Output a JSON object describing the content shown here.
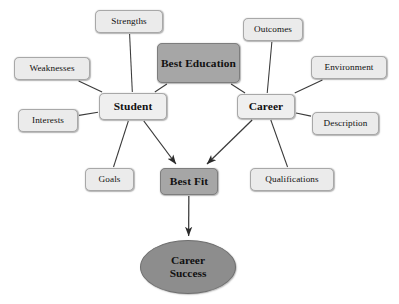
{
  "diagram": {
    "background_color": "#ffffff",
    "colors": {
      "leaf_fill": "#ebebeb",
      "hub_fill": "#efefef",
      "emphasis_fill": "#a6a6a6",
      "terminal_fill": "#8d8d8d",
      "border": "#a8a8a8",
      "line": "#3a3a3a",
      "text": "#111111"
    },
    "nodes": [
      {
        "id": "strengths",
        "label": "Strengths",
        "kind": "leaf",
        "x": 95,
        "y": 10,
        "w": 68,
        "h": 23
      },
      {
        "id": "weaknesses",
        "label": "Weaknesses",
        "kind": "leaf",
        "x": 14,
        "y": 57,
        "w": 76,
        "h": 23
      },
      {
        "id": "interests",
        "label": "Interests",
        "kind": "leaf",
        "x": 18,
        "y": 109,
        "w": 60,
        "h": 23
      },
      {
        "id": "goals",
        "label": "Goals",
        "kind": "leaf",
        "x": 85,
        "y": 168,
        "w": 49,
        "h": 23
      },
      {
        "id": "student",
        "label": "Student",
        "kind": "hub",
        "x": 99,
        "y": 93,
        "w": 68,
        "h": 27
      },
      {
        "id": "best-education",
        "label": "Best Education",
        "kind": "emphasis",
        "x": 157,
        "y": 43,
        "w": 83,
        "h": 40
      },
      {
        "id": "outcomes",
        "label": "Outcomes",
        "kind": "leaf",
        "x": 243,
        "y": 18,
        "w": 60,
        "h": 23
      },
      {
        "id": "environment",
        "label": "Environment",
        "kind": "leaf",
        "x": 311,
        "y": 56,
        "w": 76,
        "h": 23
      },
      {
        "id": "description",
        "label": "Description",
        "kind": "leaf",
        "x": 312,
        "y": 112,
        "w": 67,
        "h": 23
      },
      {
        "id": "qualifications",
        "label": "Qualifications",
        "kind": "leaf",
        "x": 250,
        "y": 168,
        "w": 84,
        "h": 23
      },
      {
        "id": "career",
        "label": "Career",
        "kind": "hub",
        "x": 237,
        "y": 94,
        "w": 58,
        "h": 25
      },
      {
        "id": "best-fit",
        "label": "Best Fit",
        "kind": "emphasis",
        "x": 160,
        "y": 168,
        "w": 58,
        "h": 27
      },
      {
        "id": "career-success",
        "label_line1": "Career",
        "label_line2": "Success",
        "kind": "terminal",
        "x": 140,
        "y": 240,
        "w": 96,
        "h": 54
      }
    ],
    "edges": [
      {
        "from": "strengths",
        "to": "student",
        "arrow": false
      },
      {
        "from": "weaknesses",
        "to": "student",
        "arrow": false
      },
      {
        "from": "interests",
        "to": "student",
        "arrow": false
      },
      {
        "from": "goals",
        "to": "student",
        "arrow": false
      },
      {
        "from": "best-education",
        "to": "student",
        "arrow": false
      },
      {
        "from": "best-education",
        "to": "career",
        "arrow": false
      },
      {
        "from": "outcomes",
        "to": "career",
        "arrow": false
      },
      {
        "from": "environment",
        "to": "career",
        "arrow": false
      },
      {
        "from": "description",
        "to": "career",
        "arrow": false
      },
      {
        "from": "qualifications",
        "to": "career",
        "arrow": false
      },
      {
        "from": "student",
        "to": "best-fit",
        "arrow": true
      },
      {
        "from": "career",
        "to": "best-fit",
        "arrow": true
      },
      {
        "from": "best-fit",
        "to": "career-success",
        "arrow": true
      }
    ]
  }
}
